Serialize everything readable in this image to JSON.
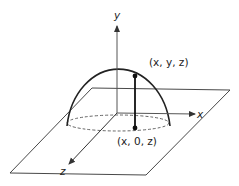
{
  "diagram": {
    "axes": {
      "x_label": "x",
      "y_label": "y",
      "z_label": "z"
    },
    "points": {
      "upper_label": "(x, y, z)",
      "lower_label": "(x, 0, z)"
    },
    "colors": {
      "stroke": "#222222",
      "axis": "#555555",
      "background": "#ffffff"
    }
  }
}
